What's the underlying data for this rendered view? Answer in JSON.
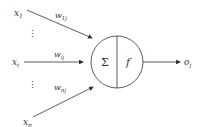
{
  "diagram": {
    "type": "artificial-neuron",
    "inputs": [
      {
        "label": "x",
        "sub": "1",
        "weight": "w",
        "weight_sub": "1j"
      },
      {
        "label": "x",
        "sub": "i",
        "weight": "w",
        "weight_sub": "ij"
      },
      {
        "label": "x",
        "sub": "n",
        "weight": "w",
        "weight_sub": "nj"
      }
    ],
    "ellipsis": "⋮",
    "node": {
      "sum_symbol": "Σ",
      "activation_symbol": "f"
    },
    "output": {
      "label": "o",
      "sub": "j"
    },
    "colors": {
      "stroke": "#333333",
      "background": "#ffffff"
    }
  }
}
